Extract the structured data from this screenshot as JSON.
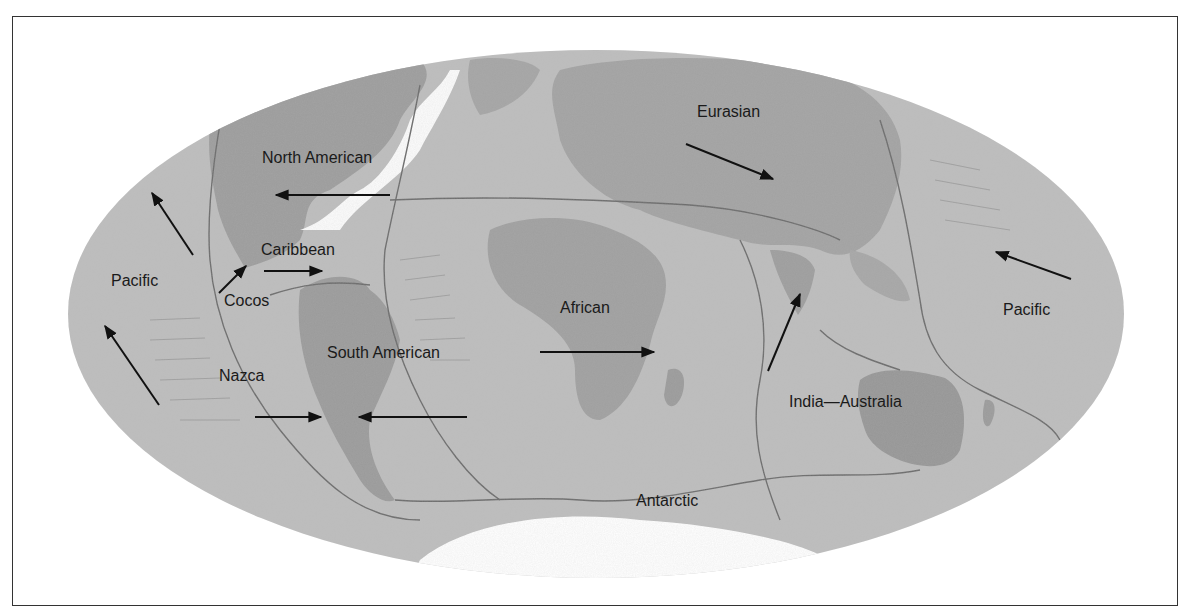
{
  "map": {
    "title": "Tectonic plates and motion directions",
    "colors": {
      "ocean": "#b9b9b9",
      "land": "#9a9a9a",
      "ice": "#ffffff",
      "boundary": "#6e6e6e",
      "arrow": "#111111",
      "frame": "#333333"
    },
    "plates": [
      {
        "id": "north-american",
        "label": "North American",
        "x": 262,
        "y": 150
      },
      {
        "id": "caribbean",
        "label": "Caribbean",
        "x": 261,
        "y": 242
      },
      {
        "id": "cocos",
        "label": "Cocos",
        "x": 224,
        "y": 293
      },
      {
        "id": "pacific-west",
        "label": "Pacific",
        "x": 111,
        "y": 273
      },
      {
        "id": "nazca",
        "label": "Nazca",
        "x": 219,
        "y": 368
      },
      {
        "id": "south-american",
        "label": "South American",
        "x": 327,
        "y": 345
      },
      {
        "id": "african",
        "label": "African",
        "x": 560,
        "y": 300
      },
      {
        "id": "eurasian",
        "label": "Eurasian",
        "x": 697,
        "y": 104
      },
      {
        "id": "pacific-east",
        "label": "Pacific",
        "x": 1003,
        "y": 302
      },
      {
        "id": "india-australia",
        "label": "India—Australia",
        "x": 789,
        "y": 394
      },
      {
        "id": "antarctic",
        "label": "Antarctic",
        "x": 636,
        "y": 493
      }
    ],
    "arrows": [
      {
        "id": "north-american-motion",
        "from": [
          390,
          195
        ],
        "to": [
          276,
          195
        ]
      },
      {
        "id": "pacific-nw-motion",
        "from": [
          193,
          255
        ],
        "to": [
          152,
          193
        ]
      },
      {
        "id": "pacific-sw-motion",
        "from": [
          159,
          405
        ],
        "to": [
          105,
          326
        ]
      },
      {
        "id": "cocos-motion",
        "from": [
          219,
          293
        ],
        "to": [
          246,
          266
        ]
      },
      {
        "id": "caribbean-motion",
        "from": [
          264,
          271
        ],
        "to": [
          322,
          271
        ]
      },
      {
        "id": "nazca-motion",
        "from": [
          255,
          417
        ],
        "to": [
          321,
          417
        ]
      },
      {
        "id": "south-american-motion",
        "from": [
          467,
          417
        ],
        "to": [
          359,
          417
        ]
      },
      {
        "id": "african-motion",
        "from": [
          540,
          352
        ],
        "to": [
          654,
          352
        ]
      },
      {
        "id": "eurasian-motion",
        "from": [
          686,
          144
        ],
        "to": [
          773,
          179
        ]
      },
      {
        "id": "pacific-east-motion",
        "from": [
          1071,
          279
        ],
        "to": [
          996,
          252
        ]
      },
      {
        "id": "india-motion",
        "from": [
          768,
          371
        ],
        "to": [
          800,
          294
        ]
      }
    ]
  }
}
